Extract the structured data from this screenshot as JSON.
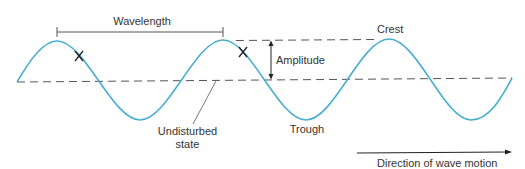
{
  "diagram": {
    "colors": {
      "wave": "#4aaed0",
      "annotation": "#555555",
      "text": "#333333",
      "background": "#ffffff"
    },
    "labels": {
      "wavelength": "Wavelength",
      "crest": "Crest",
      "amplitude": "Amplitude",
      "trough": "Trough",
      "undisturbed_line1": "Undisturbed",
      "undisturbed_line2": "state",
      "direction": "Direction of wave motion"
    },
    "markers": [
      {
        "symbol": "X",
        "description": "point on wave"
      },
      {
        "symbol": "X",
        "description": "point on wave one wavelength later"
      }
    ]
  }
}
